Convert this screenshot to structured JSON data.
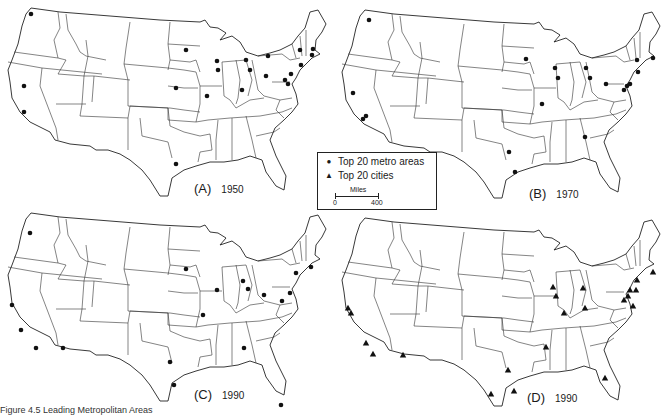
{
  "figure": {
    "caption": "Figure 4.5   Leading Metropolitan Areas"
  },
  "legend": {
    "metro_symbol": "●",
    "metro_label": "Top 20 metro areas",
    "city_symbol": "▲",
    "city_label": "Top 20 cities",
    "scale_title": "Miles",
    "scale_min": "0",
    "scale_max": "400"
  },
  "panels": [
    {
      "id": "A",
      "letter": "(A)",
      "year": "1950",
      "marker": "circle",
      "points": [
        [
          31,
          14
        ],
        [
          24,
          86
        ],
        [
          24,
          112
        ],
        [
          186,
          50
        ],
        [
          217,
          61
        ],
        [
          218,
          70
        ],
        [
          246,
          60
        ],
        [
          268,
          56
        ],
        [
          300,
          50
        ],
        [
          313,
          49
        ],
        [
          312,
          55
        ],
        [
          301,
          65
        ],
        [
          250,
          70
        ],
        [
          266,
          76
        ],
        [
          291,
          74
        ],
        [
          285,
          80
        ],
        [
          288,
          84
        ],
        [
          176,
          88
        ],
        [
          207,
          96
        ],
        [
          242,
          90
        ],
        [
          176,
          164
        ]
      ]
    },
    {
      "id": "B",
      "letter": "(B)",
      "year": "1970",
      "marker": "circle",
      "points": [
        [
          35,
          18
        ],
        [
          19,
          91
        ],
        [
          29,
          117
        ],
        [
          32,
          114
        ],
        [
          192,
          57
        ],
        [
          221,
          66
        ],
        [
          224,
          76
        ],
        [
          252,
          66
        ],
        [
          256,
          76
        ],
        [
          272,
          82
        ],
        [
          303,
          58
        ],
        [
          319,
          56
        ],
        [
          304,
          70
        ],
        [
          296,
          82
        ],
        [
          290,
          88
        ],
        [
          293,
          84
        ],
        [
          208,
          102
        ],
        [
          251,
          135
        ],
        [
          175,
          150
        ],
        [
          181,
          170
        ]
      ]
    },
    {
      "id": "C",
      "letter": "(C)",
      "year": "1990",
      "marker": "circle",
      "points": [
        [
          30,
          28
        ],
        [
          12,
          100
        ],
        [
          21,
          125
        ],
        [
          36,
          143
        ],
        [
          63,
          143
        ],
        [
          186,
          64
        ],
        [
          217,
          85
        ],
        [
          243,
          76
        ],
        [
          248,
          84
        ],
        [
          264,
          90
        ],
        [
          290,
          88
        ],
        [
          282,
          96
        ],
        [
          296,
          68
        ],
        [
          311,
          62
        ],
        [
          203,
          110
        ],
        [
          244,
          143
        ],
        [
          170,
          157
        ],
        [
          174,
          180
        ],
        [
          281,
          200
        ]
      ]
    },
    {
      "id": "D",
      "letter": "(D)",
      "year": "1990",
      "marker": "triangle",
      "points": [
        [
          14,
          98
        ],
        [
          17,
          103
        ],
        [
          32,
          133
        ],
        [
          39,
          144
        ],
        [
          69,
          145
        ],
        [
          219,
          77
        ],
        [
          249,
          78
        ],
        [
          222,
          86
        ],
        [
          230,
          103
        ],
        [
          251,
          98
        ],
        [
          296,
          80
        ],
        [
          294,
          86
        ],
        [
          290,
          90
        ],
        [
          299,
          96
        ],
        [
          302,
          80
        ],
        [
          319,
          62
        ],
        [
          303,
          70
        ],
        [
          212,
          137
        ],
        [
          174,
          160
        ],
        [
          157,
          184
        ],
        [
          180,
          181
        ],
        [
          271,
          168
        ]
      ]
    }
  ]
}
